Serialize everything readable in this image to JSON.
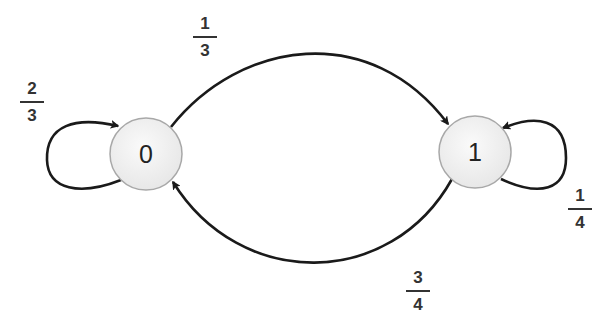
{
  "diagram": {
    "type": "markov-chain-state-diagram",
    "colors": {
      "edge": "#1a1a1a",
      "node_fill": "#efefef",
      "node_border": "#a8a8a8",
      "text": "#333333"
    },
    "nodes": [
      {
        "id": "0",
        "label": "0"
      },
      {
        "id": "1",
        "label": "1"
      }
    ],
    "edges": [
      {
        "from": "0",
        "to": "0",
        "prob": {
          "num": "2",
          "den": "3"
        }
      },
      {
        "from": "0",
        "to": "1",
        "prob": {
          "num": "1",
          "den": "3"
        }
      },
      {
        "from": "1",
        "to": "1",
        "prob": {
          "num": "1",
          "den": "4"
        }
      },
      {
        "from": "1",
        "to": "0",
        "prob": {
          "num": "3",
          "den": "4"
        }
      }
    ]
  }
}
